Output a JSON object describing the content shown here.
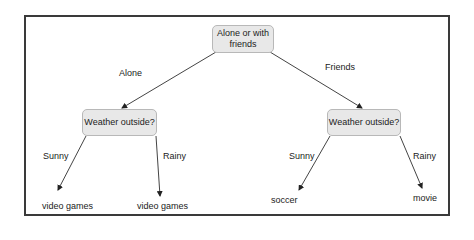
{
  "root": {
    "label": "Alone or with friends"
  },
  "edges": {
    "alone": "Alone",
    "friends": "Friends",
    "left_sunny": "Sunny",
    "left_rainy": "Rainy",
    "right_sunny": "Sunny",
    "right_rainy": "Rainy"
  },
  "nodes": {
    "left_weather": "Weather outside?",
    "right_weather": "Weather outside?"
  },
  "leaves": {
    "left_sunny": "video games",
    "left_rainy": "video games",
    "right_sunny": "soccer",
    "right_rainy": "movie"
  },
  "colors": {
    "node_fill": "#e8e8e8",
    "node_border": "#b8b8b8",
    "line": "#333333"
  }
}
